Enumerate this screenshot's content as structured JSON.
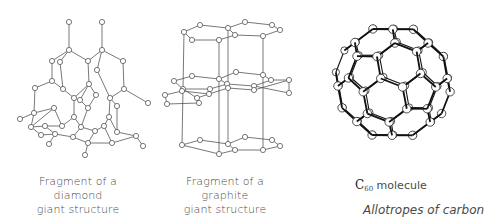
{
  "figure": {
    "title": "Allotropes of carbon",
    "colors": {
      "bond": "#555555",
      "atom_stroke": "#555555",
      "atom_fill": "#ffffff",
      "c60_bond": "#111111",
      "text": "#4a4a4a"
    },
    "panels": [
      {
        "id": "diamond",
        "caption_lines": [
          "Fragment of a",
          "diamond",
          "giant structure"
        ],
        "atoms": [
          [
            69,
            22
          ],
          [
            102,
            22
          ],
          [
            69,
            50
          ],
          [
            102,
            50
          ],
          [
            52,
            61
          ],
          [
            60,
            62
          ],
          [
            88,
            61
          ],
          [
            97,
            70
          ],
          [
            123,
            61
          ],
          [
            52,
            81
          ],
          [
            35,
            88
          ],
          [
            63,
            89
          ],
          [
            89,
            84
          ],
          [
            124,
            89
          ],
          [
            148,
            103
          ],
          [
            54,
            108
          ],
          [
            74,
            98
          ],
          [
            80,
            100
          ],
          [
            96,
            95
          ],
          [
            110,
            98
          ],
          [
            117,
            106
          ],
          [
            34,
            113
          ],
          [
            88,
            108
          ],
          [
            20,
            119
          ],
          [
            31,
            127
          ],
          [
            45,
            126
          ],
          [
            62,
            126
          ],
          [
            74,
            117
          ],
          [
            95,
            131
          ],
          [
            81,
            127
          ],
          [
            104,
            126
          ],
          [
            109,
            117
          ],
          [
            117,
            132
          ],
          [
            41,
            135
          ],
          [
            55,
            134
          ],
          [
            73,
            137
          ],
          [
            88,
            143
          ],
          [
            112,
            143
          ],
          [
            136,
            136
          ],
          [
            143,
            146
          ],
          [
            49,
            144
          ],
          [
            85,
            155
          ]
        ],
        "bonds": [
          [
            0,
            2
          ],
          [
            1,
            3
          ],
          [
            2,
            4
          ],
          [
            2,
            6
          ],
          [
            3,
            6
          ],
          [
            3,
            8
          ],
          [
            2,
            5
          ],
          [
            3,
            7
          ],
          [
            4,
            9
          ],
          [
            6,
            12
          ],
          [
            8,
            13
          ],
          [
            13,
            14
          ],
          [
            9,
            10
          ],
          [
            9,
            11
          ],
          [
            10,
            21
          ],
          [
            11,
            16
          ],
          [
            12,
            16
          ],
          [
            12,
            17
          ],
          [
            13,
            19
          ],
          [
            12,
            18
          ],
          [
            5,
            11
          ],
          [
            7,
            19
          ],
          [
            21,
            15
          ],
          [
            16,
            27
          ],
          [
            17,
            22
          ],
          [
            18,
            22
          ],
          [
            19,
            31
          ],
          [
            19,
            20
          ],
          [
            15,
            26
          ],
          [
            21,
            23
          ],
          [
            21,
            24
          ],
          [
            24,
            25
          ],
          [
            25,
            26
          ],
          [
            26,
            27
          ],
          [
            27,
            29
          ],
          [
            29,
            28
          ],
          [
            28,
            30
          ],
          [
            30,
            31
          ],
          [
            31,
            32
          ],
          [
            20,
            32
          ],
          [
            24,
            33
          ],
          [
            33,
            34
          ],
          [
            34,
            35
          ],
          [
            35,
            36
          ],
          [
            36,
            37
          ],
          [
            37,
            38
          ],
          [
            32,
            38
          ],
          [
            38,
            39
          ],
          [
            34,
            40
          ],
          [
            36,
            41
          ],
          [
            25,
            34
          ],
          [
            29,
            35
          ],
          [
            28,
            36
          ],
          [
            30,
            37
          ],
          [
            22,
            29
          ],
          [
            15,
            24
          ]
        ]
      },
      {
        "id": "graphite",
        "caption_lines": [
          "Fragment of a",
          "graphite",
          "giant structure"
        ],
        "atoms": [
          [
            184,
            32
          ],
          [
            200,
            25
          ],
          [
            228,
            28
          ],
          [
            245,
            22
          ],
          [
            272,
            25
          ],
          [
            280,
            30
          ],
          [
            263,
            36
          ],
          [
            235,
            35
          ],
          [
            219,
            40
          ],
          [
            192,
            40
          ],
          [
            174,
            81
          ],
          [
            192,
            76
          ],
          [
            219,
            79
          ],
          [
            236,
            72
          ],
          [
            263,
            75
          ],
          [
            271,
            80
          ],
          [
            254,
            86
          ],
          [
            227,
            84
          ],
          [
            210,
            89
          ],
          [
            183,
            89
          ],
          [
            165,
            95
          ],
          [
            182,
            91
          ],
          [
            209,
            94
          ],
          [
            228,
            88
          ],
          [
            254,
            90
          ],
          [
            289,
            80
          ],
          [
            289,
            93
          ],
          [
            197,
            98
          ],
          [
            167,
            104
          ],
          [
            199,
            103
          ],
          [
            182,
            145
          ],
          [
            200,
            140
          ],
          [
            228,
            144
          ],
          [
            245,
            137
          ],
          [
            272,
            140
          ],
          [
            280,
            146
          ],
          [
            263,
            150
          ],
          [
            235,
            150
          ],
          [
            219,
            154
          ]
        ],
        "bonds": [
          [
            0,
            1
          ],
          [
            1,
            2
          ],
          [
            2,
            3
          ],
          [
            3,
            4
          ],
          [
            4,
            5
          ],
          [
            5,
            6
          ],
          [
            6,
            7
          ],
          [
            7,
            2
          ],
          [
            7,
            8
          ],
          [
            8,
            9
          ],
          [
            9,
            0
          ],
          [
            10,
            11
          ],
          [
            11,
            12
          ],
          [
            12,
            13
          ],
          [
            13,
            14
          ],
          [
            14,
            15
          ],
          [
            15,
            16
          ],
          [
            16,
            17
          ],
          [
            17,
            12
          ],
          [
            17,
            18
          ],
          [
            18,
            19
          ],
          [
            19,
            10
          ],
          [
            20,
            21
          ],
          [
            21,
            22
          ],
          [
            22,
            23
          ],
          [
            23,
            24
          ],
          [
            24,
            25
          ],
          [
            25,
            15
          ],
          [
            16,
            26
          ],
          [
            26,
            25
          ],
          [
            19,
            27
          ],
          [
            27,
            22
          ],
          [
            20,
            28
          ],
          [
            28,
            29
          ],
          [
            29,
            27
          ],
          [
            30,
            31
          ],
          [
            31,
            32
          ],
          [
            32,
            33
          ],
          [
            33,
            34
          ],
          [
            34,
            35
          ],
          [
            35,
            36
          ],
          [
            36,
            37
          ],
          [
            37,
            32
          ],
          [
            37,
            38
          ],
          [
            38,
            30
          ],
          [
            0,
            30
          ],
          [
            8,
            38
          ],
          [
            2,
            32
          ],
          [
            6,
            36
          ]
        ]
      }
    ],
    "c60_caption": {
      "prefix": "C",
      "subscript": "60",
      "suffix": " molecule"
    }
  }
}
